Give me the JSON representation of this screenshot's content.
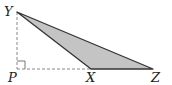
{
  "diagram": {
    "type": "geometry",
    "points": {
      "Y": {
        "label": "Y",
        "x": 17,
        "y": 12
      },
      "P": {
        "label": "P",
        "x": 17,
        "y": 69
      },
      "X": {
        "label": "X",
        "x": 91,
        "y": 69
      },
      "Z": {
        "label": "Z",
        "x": 153,
        "y": 69
      }
    },
    "shaded_polygon": [
      "Y",
      "X",
      "Z"
    ],
    "dashed_segments": [
      [
        "Y",
        "P"
      ],
      [
        "P",
        "X"
      ]
    ],
    "right_angle_at": "P",
    "colors": {
      "fill": "#c4c4c4",
      "stroke": "#333333",
      "dashed": "#888888"
    }
  }
}
